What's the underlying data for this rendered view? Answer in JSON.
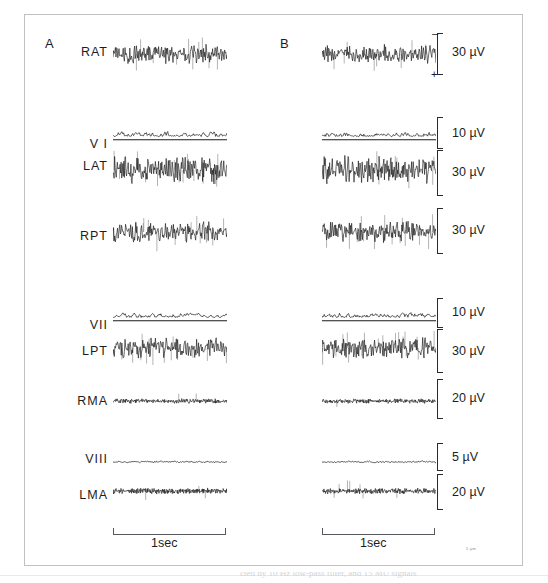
{
  "figure": {
    "panels": [
      {
        "id": "A",
        "letter": "A"
      },
      {
        "id": "B",
        "letter": "B"
      }
    ],
    "time_bar_label": "1sec",
    "time_bar_seconds": 1,
    "polarity_top": "–",
    "polarity_bottom": "+",
    "corner_mark": "5 µm",
    "caption_partial": "cted by 10 Hz low-pass filter, and 15 MU signals"
  },
  "chart_data": {
    "type": "line",
    "title": "",
    "xlabel": "Time",
    "ylabel": "Amplitude",
    "layout": "two-column multi-channel electrophysiology traces (A = left condition, B = right condition)",
    "grid": false,
    "legend": "none",
    "x_axis": {
      "units": "sec",
      "scalebar": "1sec",
      "range": [
        0,
        1
      ]
    },
    "channels": [
      {
        "name": "RAT",
        "label": "RAT",
        "row": 1,
        "kind": "emg-burst",
        "scale_uv": 30,
        "scale_label": "30 µV",
        "polarity_marked": true,
        "amplitude_rel": 1.0,
        "density": 190,
        "spike_rate": 0.3
      },
      {
        "name": "VI",
        "label": "V I",
        "row": 2,
        "kind": "rectified-integrated",
        "scale_uv": 10,
        "scale_label": "10 µV",
        "polarity_marked": false,
        "amplitude_rel": 0.42,
        "density": 150,
        "spike_rate": 0.0,
        "has_baseline": true
      },
      {
        "name": "LAT",
        "label": "LAT",
        "row": 3,
        "kind": "emg-burst",
        "scale_uv": 30,
        "scale_label": "30 µV",
        "polarity_marked": false,
        "amplitude_rel": 1.35,
        "density": 210,
        "spike_rate": 0.55
      },
      {
        "name": "RPT",
        "label": "RPT",
        "row": 4,
        "kind": "emg-burst",
        "scale_uv": 30,
        "scale_label": "30 µV",
        "polarity_marked": false,
        "amplitude_rel": 1.0,
        "density": 200,
        "spike_rate": 0.45
      },
      {
        "name": "VII",
        "label": "VII",
        "row": 5,
        "kind": "rectified-integrated",
        "scale_uv": 10,
        "scale_label": "10 µV",
        "polarity_marked": false,
        "amplitude_rel": 0.42,
        "density": 150,
        "spike_rate": 0.0,
        "has_baseline": true
      },
      {
        "name": "LPT",
        "label": "LPT",
        "row": 6,
        "kind": "emg-burst",
        "scale_uv": 30,
        "scale_label": "30 µV",
        "polarity_marked": false,
        "amplitude_rel": 1.15,
        "density": 180,
        "spike_rate": 0.6
      },
      {
        "name": "RMA",
        "label": "RMA",
        "row": 7,
        "kind": "emg-dense",
        "scale_uv": 20,
        "scale_label": "20 µV",
        "polarity_marked": false,
        "amplitude_rel": 0.4,
        "density": 300,
        "spike_rate": 0.05
      },
      {
        "name": "VIII",
        "label": "VIII",
        "row": 8,
        "kind": "rectified-integrated",
        "scale_uv": 5,
        "scale_label": "5 µV",
        "polarity_marked": false,
        "amplitude_rel": 0.12,
        "density": 120,
        "spike_rate": 0.0,
        "has_baseline": true
      },
      {
        "name": "LMA",
        "label": "LMA",
        "row": 9,
        "kind": "emg-dense",
        "scale_uv": 20,
        "scale_label": "20 µV",
        "polarity_marked": false,
        "amplitude_rel": 0.5,
        "density": 300,
        "spike_rate": 0.08
      }
    ],
    "scale_labels_A": [],
    "scale_labels_B": [
      "30 µV",
      "10 µV",
      "30 µV",
      "30 µV",
      "10 µV",
      "30 µV",
      "20 µV",
      "5 µV",
      "20 µV"
    ]
  },
  "colors": {
    "trace": "#1a1a1a",
    "frame": "#bfc2c5",
    "text": "#1d1d1d",
    "scalebar": "#2a2a2a",
    "background": "#ffffff"
  }
}
